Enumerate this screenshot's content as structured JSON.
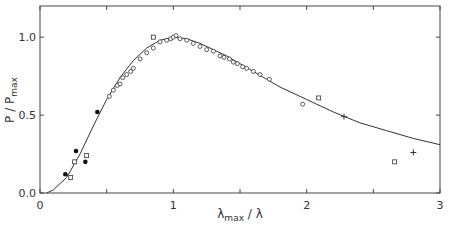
{
  "chart_data": {
    "type": "scatter",
    "title": "",
    "xlabel": "λmax / λ",
    "ylabel": "P / Pmax",
    "xlim": [
      0,
      3
    ],
    "ylim": [
      0,
      1.2
    ],
    "xticks": [
      "0",
      "1",
      "2",
      "3"
    ],
    "yticks": [
      "0.0",
      "0.5",
      "1.0"
    ],
    "grid": false,
    "series": [
      {
        "name": "open circles",
        "marker": "circle-open",
        "x": [
          0.52,
          0.55,
          0.58,
          0.6,
          0.62,
          0.65,
          0.68,
          0.7,
          0.75,
          0.8,
          0.85,
          0.9,
          0.95,
          0.98,
          1.0,
          1.02,
          1.05,
          1.1,
          1.15,
          1.2,
          1.25,
          1.3,
          1.35,
          1.38,
          1.42,
          1.45,
          1.48,
          1.52,
          1.55,
          1.6,
          1.65,
          1.72,
          1.97
        ],
        "y": [
          0.62,
          0.66,
          0.69,
          0.7,
          0.74,
          0.76,
          0.78,
          0.8,
          0.86,
          0.9,
          0.93,
          0.97,
          0.98,
          0.99,
          1.0,
          1.01,
          0.99,
          0.98,
          0.96,
          0.94,
          0.92,
          0.91,
          0.88,
          0.87,
          0.86,
          0.84,
          0.83,
          0.81,
          0.8,
          0.78,
          0.76,
          0.73,
          0.57
        ]
      },
      {
        "name": "filled circles",
        "marker": "circle-filled",
        "x": [
          0.19,
          0.27,
          0.34,
          0.43
        ],
        "y": [
          0.12,
          0.27,
          0.2,
          0.52
        ]
      },
      {
        "name": "open squares",
        "marker": "square-open",
        "x": [
          0.23,
          0.26,
          0.35,
          0.85,
          2.09,
          2.66
        ],
        "y": [
          0.1,
          0.2,
          0.24,
          1.0,
          0.61,
          0.2
        ]
      },
      {
        "name": "plus",
        "marker": "plus",
        "x": [
          2.28,
          2.8
        ],
        "y": [
          0.49,
          0.26
        ]
      },
      {
        "name": "fit curve",
        "marker": "line",
        "x": [
          0.05,
          0.1,
          0.2,
          0.3,
          0.4,
          0.5,
          0.6,
          0.7,
          0.8,
          0.9,
          1.0,
          1.1,
          1.2,
          1.4,
          1.6,
          1.8,
          2.0,
          2.2,
          2.4,
          2.6,
          2.8,
          3.0
        ],
        "y": [
          0.0,
          0.02,
          0.1,
          0.25,
          0.43,
          0.6,
          0.74,
          0.85,
          0.93,
          0.98,
          1.0,
          0.99,
          0.96,
          0.88,
          0.78,
          0.68,
          0.6,
          0.52,
          0.45,
          0.4,
          0.35,
          0.31
        ]
      }
    ]
  }
}
